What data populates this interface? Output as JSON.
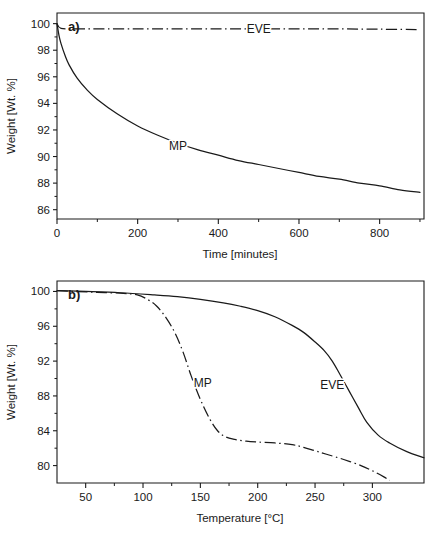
{
  "figure": {
    "background": "#ffffff",
    "ink_color": "#1a1a1a"
  },
  "panels": [
    {
      "id": "a",
      "panel_label": "a)",
      "xlabel": "Time [minutes]",
      "ylabel": "Weight [Wt. %]",
      "x_ticks": [
        "0",
        "200",
        "400",
        "600",
        "800"
      ],
      "y_ticks": [
        "86",
        "88",
        "90",
        "92",
        "94",
        "96",
        "98",
        "100"
      ],
      "series_labels": [
        "MP",
        "EVE"
      ]
    },
    {
      "id": "b",
      "panel_label": "b)",
      "xlabel": "Temperature [°C]",
      "ylabel": "Weight [Wt. %]",
      "x_ticks": [
        "50",
        "100",
        "150",
        "200",
        "250",
        "300"
      ],
      "y_ticks": [
        "80",
        "84",
        "88",
        "92",
        "96",
        "100"
      ],
      "series_labels": [
        "MP",
        "EVE"
      ]
    }
  ],
  "chart_data": [
    {
      "type": "line",
      "panel": "a",
      "title": "a)",
      "xlabel": "Time [minutes]",
      "ylabel": "Weight [Wt. %]",
      "xlim": [
        0,
        910
      ],
      "ylim": [
        85.3,
        100.8
      ],
      "x_ticks": [
        0,
        200,
        400,
        600,
        800
      ],
      "y_ticks": [
        86,
        88,
        90,
        92,
        94,
        96,
        98,
        100
      ],
      "minor_x_ticks": [
        100,
        300,
        500,
        700,
        900
      ],
      "grid": false,
      "legend": "inline-labels",
      "series": [
        {
          "name": "MP",
          "style": "solid",
          "label_at": [
            300,
            90.8
          ],
          "x": [
            0,
            5,
            10,
            20,
            30,
            50,
            75,
            100,
            150,
            200,
            250,
            300,
            350,
            400,
            450,
            500,
            550,
            600,
            650,
            700,
            750,
            800,
            850,
            900
          ],
          "y": [
            100.0,
            99.1,
            98.5,
            97.6,
            96.9,
            95.9,
            95.0,
            94.3,
            93.2,
            92.3,
            91.6,
            91.0,
            90.5,
            90.1,
            89.7,
            89.4,
            89.1,
            88.8,
            88.5,
            88.3,
            88.0,
            87.8,
            87.5,
            87.3
          ]
        },
        {
          "name": "EVE",
          "style": "dash-dot",
          "label_at": [
            500,
            99.6
          ],
          "x": [
            0,
            10,
            50,
            100,
            200,
            300,
            400,
            500,
            600,
            700,
            800,
            900
          ],
          "y": [
            100.0,
            99.65,
            99.6,
            99.6,
            99.6,
            99.6,
            99.6,
            99.6,
            99.6,
            99.6,
            99.58,
            99.55
          ]
        }
      ]
    },
    {
      "type": "line",
      "panel": "b",
      "title": "b)",
      "xlabel": "Temperature [°C]",
      "ylabel": "Weight [Wt. %]",
      "xlim": [
        25,
        345
      ],
      "ylim": [
        78.0,
        101.2
      ],
      "x_ticks": [
        50,
        100,
        150,
        200,
        250,
        300
      ],
      "y_ticks": [
        80,
        84,
        88,
        92,
        96,
        100
      ],
      "grid": false,
      "legend": "inline-labels",
      "series": [
        {
          "name": "MP",
          "style": "dash-dot",
          "label_at": [
            152,
            89.5
          ],
          "x": [
            25,
            40,
            60,
            80,
            95,
            105,
            112,
            120,
            128,
            135,
            142,
            150,
            158,
            165,
            172,
            180,
            190,
            200,
            215,
            230,
            240,
            250,
            260,
            275,
            290,
            300,
            310,
            315
          ],
          "y": [
            100.1,
            100.0,
            99.9,
            99.8,
            99.6,
            99.0,
            98.3,
            97.0,
            95.2,
            93.0,
            90.3,
            87.6,
            85.4,
            84.0,
            83.3,
            83.0,
            82.8,
            82.7,
            82.6,
            82.4,
            82.1,
            81.7,
            81.3,
            80.7,
            80.0,
            79.4,
            78.7,
            78.3
          ]
        },
        {
          "name": "EVE",
          "style": "solid",
          "label_at": [
            265,
            89.2
          ],
          "x": [
            25,
            50,
            80,
            110,
            130,
            150,
            170,
            185,
            200,
            215,
            230,
            240,
            250,
            258,
            265,
            272,
            280,
            288,
            295,
            305,
            315,
            330,
            345
          ],
          "y": [
            100.1,
            100.0,
            99.85,
            99.6,
            99.4,
            99.1,
            98.7,
            98.3,
            97.8,
            97.1,
            96.1,
            95.3,
            94.2,
            93.2,
            92.0,
            90.4,
            88.5,
            86.6,
            85.0,
            83.5,
            82.6,
            81.6,
            80.9
          ]
        }
      ]
    }
  ]
}
